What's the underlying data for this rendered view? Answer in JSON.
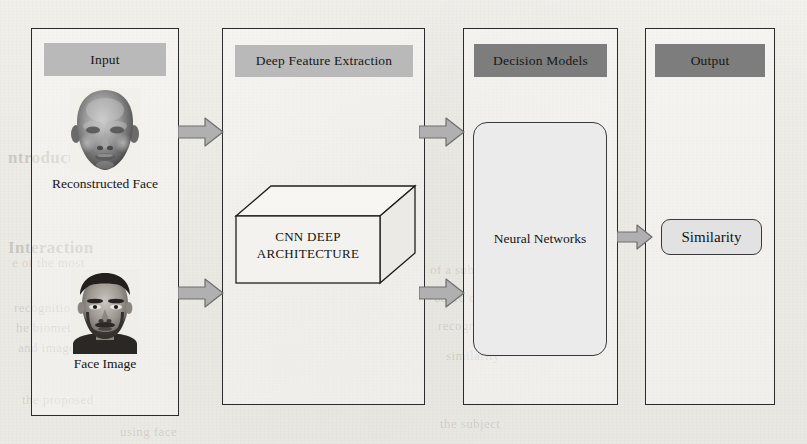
{
  "figure": {
    "type": "pipeline-diagram",
    "background_color": "#f3f1ec",
    "header_light_color": "#b9b9b9",
    "header_dark_color": "#7d7d7d",
    "arrow_fill_color": "#b0b0b0",
    "arrow_stroke_color": "#6e6e6e",
    "border_color": "#2b2b2b"
  },
  "panels": [
    {
      "id": "input",
      "header": "Input",
      "header_style": "light",
      "items": [
        {
          "label": "Reconstructed Face",
          "icon": "reconstructed-face-image"
        },
        {
          "label": "Face Image",
          "icon": "face-photo-image"
        }
      ]
    },
    {
      "id": "deep-feature-extraction",
      "header": "Deep Feature Extraction",
      "header_style": "light",
      "items": [
        {
          "label": "CNN   DEEP ARCHITECTURE",
          "icon": "cuboid-3d-shape"
        }
      ],
      "cuboid_label_line1": "CNN   DEEP",
      "cuboid_label_line2": "ARCHITECTURE"
    },
    {
      "id": "decision-models",
      "header": "Decision Models",
      "header_style": "dark",
      "items": [
        {
          "label": "Neural Networks",
          "icon": "rounded-rect-shape"
        }
      ]
    },
    {
      "id": "output",
      "header": "Output",
      "header_style": "dark",
      "items": [
        {
          "label": "Similarity",
          "icon": "rounded-pill-shape"
        }
      ]
    }
  ],
  "arrows": [
    {
      "id": "input-top-to-dfe",
      "from": "input",
      "to": "deep-feature-extraction",
      "direction": "right"
    },
    {
      "id": "input-bottom-to-dfe",
      "from": "input",
      "to": "deep-feature-extraction",
      "direction": "right"
    },
    {
      "id": "dfe-top-to-decision",
      "from": "deep-feature-extraction",
      "to": "decision-models",
      "direction": "right"
    },
    {
      "id": "dfe-bottom-to-decision",
      "from": "deep-feature-extraction",
      "to": "decision-models",
      "direction": "right"
    },
    {
      "id": "decision-to-output",
      "from": "decision-models",
      "to": "output",
      "direction": "right"
    }
  ],
  "bleed_through_text": [
    {
      "text": "ntroduction",
      "x": 8,
      "y": 148,
      "size": "big"
    },
    {
      "text": "Interaction",
      "x": 8,
      "y": 238,
      "size": "big"
    },
    {
      "text": "e of the most",
      "x": 12,
      "y": 255,
      "size": "small"
    },
    {
      "text": "recognition",
      "x": 14,
      "y": 300,
      "size": "small"
    },
    {
      "text": "he biometric",
      "x": 16,
      "y": 320,
      "size": "small"
    },
    {
      "text": "and images",
      "x": 18,
      "y": 340,
      "size": "small"
    },
    {
      "text": "the proposed",
      "x": 22,
      "y": 392,
      "size": "small"
    },
    {
      "text": "using face",
      "x": 120,
      "y": 424,
      "size": "small"
    },
    {
      "text": "of a subject",
      "x": 430,
      "y": 262,
      "size": "small"
    },
    {
      "text": "based on the",
      "x": 434,
      "y": 290,
      "size": "small"
    },
    {
      "text": "recognition",
      "x": 438,
      "y": 318,
      "size": "small"
    },
    {
      "text": "similarity",
      "x": 446,
      "y": 348,
      "size": "small"
    },
    {
      "text": "the subject",
      "x": 440,
      "y": 416,
      "size": "small"
    }
  ]
}
